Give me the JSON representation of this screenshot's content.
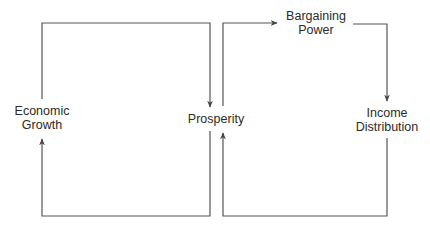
{
  "diagram": {
    "type": "flow",
    "nodes": {
      "economic_growth": {
        "line1": "Economic",
        "line2": "Growth"
      },
      "prosperity": {
        "label": "Prosperity"
      },
      "bargaining_power": {
        "line1": "Bargaining",
        "line2": "Power"
      },
      "income_distribution": {
        "line1": "Income",
        "line2": "Distribution"
      }
    },
    "edges": [
      {
        "from": "Economic Growth",
        "to": "Prosperity"
      },
      {
        "from": "Prosperity",
        "to": "Economic Growth"
      },
      {
        "from": "Prosperity",
        "to": "Bargaining Power"
      },
      {
        "from": "Bargaining Power",
        "to": "Income Distribution"
      },
      {
        "from": "Income Distribution",
        "to": "Prosperity"
      }
    ],
    "colors": {
      "line": "#555555",
      "text": "#2a2a2a"
    }
  }
}
